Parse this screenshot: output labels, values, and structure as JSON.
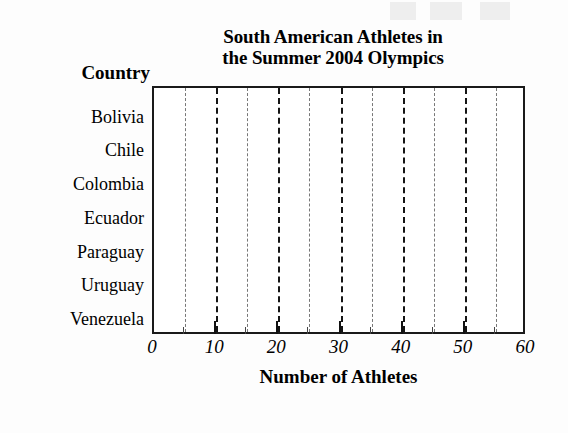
{
  "chart_data": {
    "type": "bar",
    "orientation": "horizontal",
    "title": "South American Athletes in the Summer 2004 Olympics",
    "title_lines": [
      "South American Athletes in",
      "the Summer 2004 Olympics"
    ],
    "category_axis_title": "Country",
    "xlabel": "Number of Athletes",
    "ylabel": "Country",
    "categories": [
      "Bolivia",
      "Chile",
      "Colombia",
      "Ecuador",
      "Paraguay",
      "Uruguay",
      "Venezuela"
    ],
    "values": [
      null,
      null,
      null,
      null,
      null,
      null,
      null
    ],
    "values_note": "blank worksheet grid — no bars are drawn",
    "xlim": [
      0,
      60
    ],
    "xticks": [
      0,
      10,
      20,
      30,
      40,
      50,
      60
    ],
    "xtick_labels": [
      "0",
      "10",
      "20",
      "30",
      "40",
      "50",
      "60"
    ],
    "minor_gridlines": [
      5,
      15,
      25,
      35,
      45,
      55
    ],
    "major_gridlines": [
      10,
      20,
      30,
      40,
      50
    ],
    "grid": true,
    "legend": null,
    "colors": {
      "frame": "#1a1a1a",
      "major_gridline": "#141414",
      "minor_gridline": "#6d6d6d",
      "text": "#000000",
      "plot_background": "#ffffff"
    }
  }
}
